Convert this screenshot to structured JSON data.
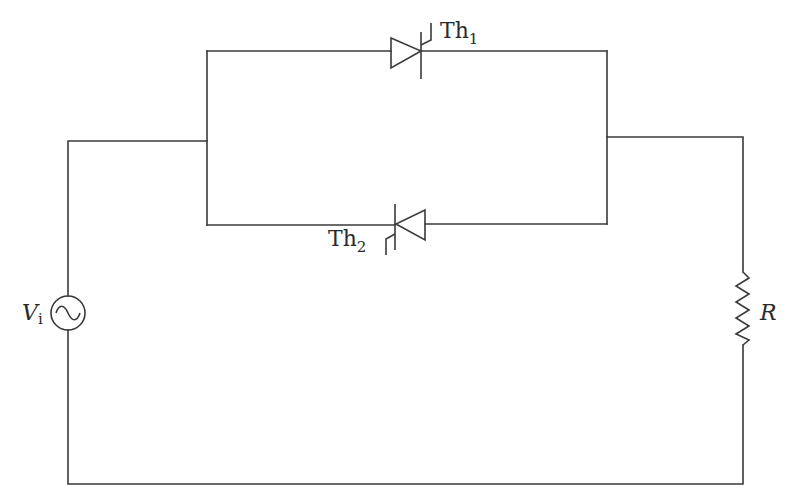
{
  "diagram": {
    "type": "circuit-schematic",
    "stroke_color": "#3a3a3a",
    "background_color": "#ffffff",
    "components": {
      "source": {
        "label_main": "V",
        "label_sub": "i",
        "symbol": "ac-voltage-source"
      },
      "thyristor_1": {
        "label_main": "Th",
        "label_sub": "1",
        "orientation": "anode-left, cathode-right",
        "branch": "top"
      },
      "thyristor_2": {
        "label_main": "Th",
        "label_sub": "2",
        "orientation": "anode-right, cathode-left",
        "branch": "bottom"
      },
      "resistor": {
        "label_main": "R",
        "symbol": "zigzag-resistor"
      }
    },
    "connections": [
      "V_i top -> left node of anti-parallel pair",
      "Th1 and Th2 in anti-parallel between left and right nodes",
      "right node -> R top",
      "R bottom -> V_i bottom (return path)"
    ]
  }
}
